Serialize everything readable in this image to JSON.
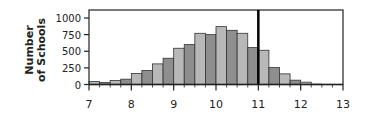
{
  "chart_data": {
    "type": "bar",
    "title": "",
    "xlabel": "",
    "ylabel": "Number of Schools",
    "ylabel_lines": [
      "Number",
      "of Schools"
    ],
    "xlim": [
      7,
      13
    ],
    "ylim": [
      0,
      1000
    ],
    "bin_width": 0.25,
    "x_ticks": [
      7,
      8,
      9,
      10,
      11,
      12,
      13
    ],
    "y_ticks": [
      0,
      250,
      500,
      750,
      1000
    ],
    "grid": false,
    "legend": null,
    "reference_line": {
      "x": 11,
      "style": "thick-black-vertical"
    },
    "bin_starts": [
      7.0,
      7.25,
      7.5,
      7.75,
      8.0,
      8.25,
      8.5,
      8.75,
      9.0,
      9.25,
      9.5,
      9.75,
      10.0,
      10.25,
      10.5,
      10.75,
      11.0,
      11.25,
      11.5,
      11.75,
      12.0,
      12.25,
      12.5,
      12.75
    ],
    "values": [
      45,
      30,
      60,
      80,
      165,
      210,
      310,
      395,
      545,
      600,
      770,
      750,
      870,
      815,
      770,
      555,
      515,
      255,
      160,
      65,
      35,
      5,
      0,
      0
    ],
    "colors": {
      "light": "#b8b8b8",
      "dark": "#8e8e8e",
      "outline": "#333333",
      "axis": "#222222",
      "reference": "#000000"
    }
  }
}
